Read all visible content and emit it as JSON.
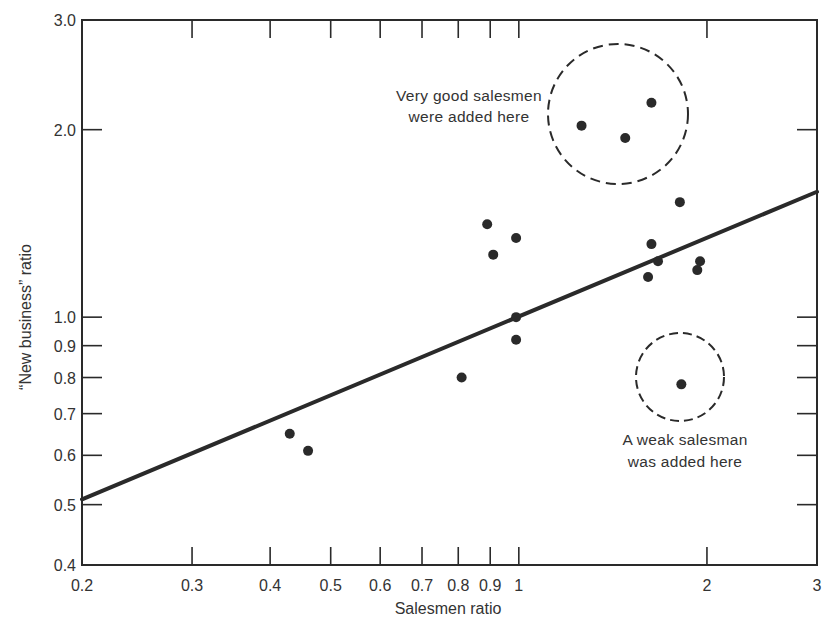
{
  "chart_data": {
    "type": "scatter",
    "title": "",
    "xlabel": "Salesmen ratio",
    "ylabel": "“New business” ratio",
    "xscale": "log",
    "yscale": "log",
    "xlim": [
      0.2,
      3
    ],
    "ylim": [
      0.4,
      3.0
    ],
    "grid": false,
    "legend": null,
    "x_ticks": [
      0.2,
      0.3,
      0.4,
      0.5,
      0.6,
      0.7,
      0.8,
      0.9,
      1,
      2,
      3
    ],
    "x_tick_labels": [
      "0.2",
      "0.3",
      "0.4",
      "0.5",
      "0.6",
      "0.7",
      "0.8",
      "0.9",
      "1",
      "2",
      "3"
    ],
    "y_ticks": [
      0.4,
      0.5,
      0.6,
      0.7,
      0.8,
      0.9,
      1.0,
      2.0,
      3.0
    ],
    "y_tick_labels": [
      "0.4",
      "0.5",
      "0.6",
      "0.7",
      "0.8",
      "0.9",
      "1.0",
      "2.0",
      "3.0"
    ],
    "series": [
      {
        "name": "Sales offices",
        "type": "scatter",
        "points": [
          {
            "x": 0.43,
            "y": 0.65
          },
          {
            "x": 0.46,
            "y": 0.61
          },
          {
            "x": 0.81,
            "y": 0.8
          },
          {
            "x": 0.89,
            "y": 1.41
          },
          {
            "x": 0.91,
            "y": 1.26
          },
          {
            "x": 0.99,
            "y": 1.34
          },
          {
            "x": 0.99,
            "y": 1.0
          },
          {
            "x": 0.99,
            "y": 0.92
          },
          {
            "x": 1.26,
            "y": 2.03
          },
          {
            "x": 1.48,
            "y": 1.94
          },
          {
            "x": 1.63,
            "y": 2.21
          },
          {
            "x": 1.81,
            "y": 1.53
          },
          {
            "x": 1.63,
            "y": 1.31
          },
          {
            "x": 1.67,
            "y": 1.23
          },
          {
            "x": 1.61,
            "y": 1.16
          },
          {
            "x": 1.95,
            "y": 1.23
          },
          {
            "x": 1.93,
            "y": 1.19
          },
          {
            "x": 1.82,
            "y": 0.78
          }
        ]
      },
      {
        "name": "Trend line",
        "type": "line",
        "points": [
          {
            "x": 0.2,
            "y": 0.51
          },
          {
            "x": 3.0,
            "y": 1.59
          }
        ]
      }
    ],
    "annotations": [
      {
        "text_lines": [
          "Very good salesmen",
          "were added here"
        ],
        "circle_center": {
          "x": 1.48,
          "y": 2.1
        },
        "encircled_points": [
          {
            "x": 1.26,
            "y": 2.03
          },
          {
            "x": 1.48,
            "y": 1.94
          },
          {
            "x": 1.63,
            "y": 2.21
          }
        ],
        "style": "dashed-circle"
      },
      {
        "text_lines": [
          "A weak salesman",
          "was added here"
        ],
        "circle_center": {
          "x": 1.82,
          "y": 0.78
        },
        "encircled_points": [
          {
            "x": 1.82,
            "y": 0.78
          }
        ],
        "style": "dashed-circle"
      }
    ]
  },
  "labels": {
    "xlabel": "Salesmen ratio",
    "ylabel": "“New business” ratio",
    "annot_good_1": "Very good salesmen",
    "annot_good_2": "were added here",
    "annot_weak_1": "A weak salesman",
    "annot_weak_2": "was added here"
  },
  "colors": {
    "ink": "#2a2a2a",
    "background": "#ffffff"
  }
}
